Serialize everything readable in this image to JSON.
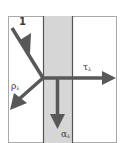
{
  "diagram": {
    "type": "radiation-interaction",
    "incident": {
      "label": "1"
    },
    "reflected": {
      "symbol": "ρ",
      "subscript": "λ"
    },
    "transmitted": {
      "symbol": "τ",
      "subscript": "λ"
    },
    "absorbed": {
      "symbol": "α",
      "subscript": "λ"
    },
    "colors": {
      "arrow": "#585858",
      "border": "#555555",
      "slab_fill": "#d6d6d6",
      "outer_border": "#aaaaaa",
      "background": "#ffffff"
    }
  }
}
